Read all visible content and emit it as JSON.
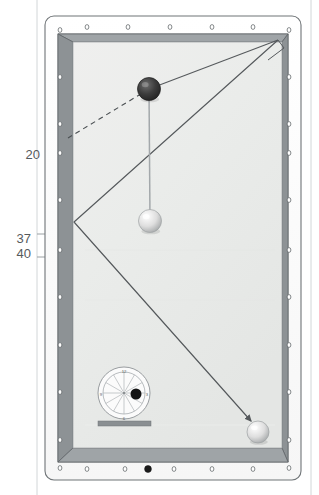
{
  "diagram": {
    "type": "pool-table-top-view",
    "orientation": "portrait"
  },
  "dimension_labels": [
    {
      "id": "label-20",
      "text": "20",
      "x": 31,
      "y": 154
    },
    {
      "id": "label-37",
      "text": "37",
      "x": 22,
      "y": 238
    },
    {
      "id": "label-40",
      "text": "40",
      "x": 22,
      "y": 253
    }
  ],
  "table": {
    "outer": {
      "x": 45,
      "y": 16,
      "width": 256,
      "height": 464,
      "radius": 9
    },
    "frame_color": "#7c8184",
    "rail_fill": "#fdfdfd",
    "cushion_color": "#8e9396",
    "cloth_color": "#eceeed",
    "cloth": {
      "x": 73,
      "y": 42,
      "width": 209,
      "height": 406
    }
  },
  "rail_markers": {
    "open_color": "#ffffff",
    "open_stroke": "#5f6467",
    "filled_color": "#1a1a1a",
    "top": [
      {
        "x": 87,
        "y": 27,
        "filled": false
      },
      {
        "x": 128,
        "y": 27,
        "filled": false
      },
      {
        "x": 170,
        "y": 27,
        "filled": false
      },
      {
        "x": 212,
        "y": 27,
        "filled": false
      },
      {
        "x": 253,
        "y": 27,
        "filled": false
      }
    ],
    "bottom": [
      {
        "x": 87,
        "y": 469,
        "filled": false
      },
      {
        "x": 125,
        "y": 469,
        "filled": false
      },
      {
        "x": 148,
        "y": 469,
        "filled": true
      },
      {
        "x": 174,
        "y": 469,
        "filled": false
      },
      {
        "x": 212,
        "y": 469,
        "filled": false
      },
      {
        "x": 253,
        "y": 469,
        "filled": false
      }
    ],
    "left": [
      {
        "x": 60,
        "y": 30,
        "filled": false
      },
      {
        "x": 60,
        "y": 77,
        "filled": false
      },
      {
        "x": 60,
        "y": 124,
        "filled": false
      },
      {
        "x": 60,
        "y": 153,
        "filled": false
      },
      {
        "x": 60,
        "y": 200,
        "filled": false
      },
      {
        "x": 60,
        "y": 250,
        "filled": false
      },
      {
        "x": 60,
        "y": 297,
        "filled": false
      },
      {
        "x": 60,
        "y": 345,
        "filled": false
      },
      {
        "x": 60,
        "y": 392,
        "filled": false
      },
      {
        "x": 60,
        "y": 440,
        "filled": false
      },
      {
        "x": 60,
        "y": 468,
        "filled": false
      }
    ],
    "right": [
      {
        "x": 289,
        "y": 30,
        "filled": false
      },
      {
        "x": 289,
        "y": 77,
        "filled": false
      },
      {
        "x": 289,
        "y": 124,
        "filled": false
      },
      {
        "x": 289,
        "y": 153,
        "filled": false
      },
      {
        "x": 289,
        "y": 200,
        "filled": false
      },
      {
        "x": 289,
        "y": 250,
        "filled": false
      },
      {
        "x": 289,
        "y": 297,
        "filled": false
      },
      {
        "x": 289,
        "y": 345,
        "filled": false
      },
      {
        "x": 289,
        "y": 392,
        "filled": false
      },
      {
        "x": 289,
        "y": 440,
        "filled": false
      },
      {
        "x": 289,
        "y": 468,
        "filled": false
      }
    ]
  },
  "balls": [
    {
      "id": "object-ball",
      "label": "object ball",
      "cx": 149,
      "cy": 89,
      "r": 11.5,
      "color": "#3b3b3b",
      "kind": "dark"
    },
    {
      "id": "cue-ball",
      "label": "cue ball",
      "cx": 150,
      "cy": 221,
      "r": 11.5,
      "color": "#e8e8e8",
      "kind": "light"
    },
    {
      "id": "target-ball",
      "label": "target ball",
      "cx": 258,
      "cy": 432,
      "r": 11,
      "color": "#f2f2f2",
      "kind": "light"
    }
  ],
  "paths": {
    "aim_line": {
      "from": [
        150,
        221
      ],
      "to": [
        149,
        89
      ],
      "style": "solid-thin",
      "color": "#9aa0a3"
    },
    "ghost_line": {
      "from": [
        149,
        89
      ],
      "to": [
        68,
        138
      ],
      "style": "dashed",
      "color": "#4a4f52"
    },
    "bank_line": {
      "points": [
        [
          149,
          89
        ],
        [
          278,
          40
        ]
      ],
      "style": "solid",
      "color": "#55595c"
    },
    "kick_line": {
      "points": [
        [
          278,
          40
        ],
        [
          74,
          222
        ],
        [
          251,
          421
        ]
      ],
      "style": "solid-arrow",
      "color": "#55595c"
    },
    "pocket_wedge": {
      "points": [
        [
          278,
          40
        ],
        [
          284,
          48
        ],
        [
          268,
          60
        ]
      ],
      "style": "solid",
      "color": "#55595c"
    },
    "arrowhead": {
      "x": 251,
      "y": 421,
      "angle": 48
    }
  },
  "english_clock": {
    "name": "tip-contact clock diagram",
    "cx": 124,
    "cy": 393,
    "outer_r": 26,
    "inner_r": 21,
    "hub_r": 1.6,
    "spokes": 12,
    "numbers": [
      {
        "text": "12",
        "x": 124,
        "y": 371
      },
      {
        "text": "3",
        "x": 147,
        "y": 394
      },
      {
        "text": "6",
        "x": 124,
        "y": 418
      },
      {
        "text": "9",
        "x": 101,
        "y": 394
      }
    ],
    "contact_dot": {
      "cx": 136,
      "cy": 394,
      "r": 5.5,
      "color": "#1a1a1a"
    },
    "bar": {
      "x": 98,
      "y": 421,
      "width": 53,
      "height": 5,
      "color": "#8a8f92"
    }
  },
  "guide_lines": {
    "vertical_left": {
      "x": 37,
      "y1": 0,
      "y2": 495,
      "color": "#cfd3d5"
    },
    "vertical_right": {
      "x": 311,
      "y1": 0,
      "y2": 495,
      "color": "#cfd3d5"
    },
    "dim_bracket": [
      {
        "x1": 37,
        "y1": 234,
        "x2": 66,
        "y2": 234
      },
      {
        "x1": 48,
        "y1": 234,
        "x2": 48,
        "y2": 257
      },
      {
        "x1": 37,
        "y1": 257,
        "x2": 66,
        "y2": 257
      }
    ]
  }
}
